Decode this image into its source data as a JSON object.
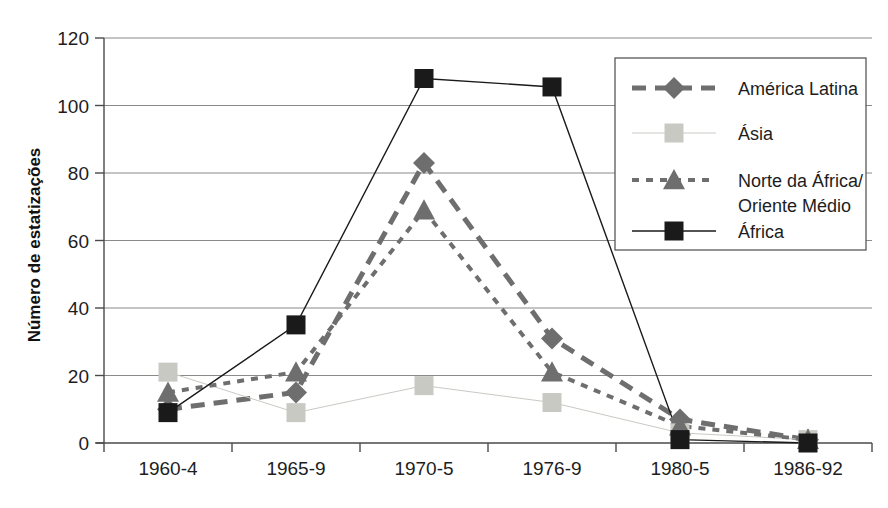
{
  "chart_data": {
    "type": "line",
    "title": "",
    "subtitle": "",
    "xlabel": "",
    "ylabel": "Número de estatizações",
    "categories": [
      "1960-4",
      "1965-9",
      "1970-5",
      "1976-9",
      "1980-5",
      "1986-92"
    ],
    "ylim": [
      0,
      120
    ],
    "yticks": [
      0,
      20,
      40,
      60,
      80,
      100,
      120
    ],
    "ytick_labels": [
      "0",
      "20",
      "40",
      "60",
      "80",
      "100",
      "120"
    ],
    "grid": true,
    "grid_axis": "y",
    "legend_position": "right-top",
    "series": [
      {
        "name": "América Latina",
        "values": [
          10,
          15,
          83,
          31,
          7,
          1
        ],
        "color": "#6e6e6e",
        "marker": "diamond",
        "line_style": "thick-dashed",
        "line_width": 5
      },
      {
        "name": "Ásia",
        "values": [
          21,
          9,
          17,
          12,
          3,
          1
        ],
        "color": "#c9c9c4",
        "marker": "square",
        "line_style": "thin-solid",
        "line_width": 1
      },
      {
        "name": "Norte da África/Oriente Médio",
        "values": [
          15,
          21,
          69,
          21,
          5,
          1
        ],
        "color": "#6e6e6e",
        "marker": "triangle",
        "line_style": "dotted",
        "line_width": 4
      },
      {
        "name": "África",
        "values": [
          9,
          35,
          108,
          105.5,
          1,
          0
        ],
        "color": "#1a1a1a",
        "marker": "square",
        "line_style": "thin-solid",
        "line_width": 1.4
      }
    ]
  },
  "legend": {
    "entries": [
      {
        "label": "América Latina",
        "label_line2": ""
      },
      {
        "label": "Ásia",
        "label_line2": ""
      },
      {
        "label": "Norte da África/",
        "label_line2": "Oriente Médio"
      },
      {
        "label": "África",
        "label_line2": ""
      }
    ]
  },
  "colors": {
    "axis": "#4a4a4a",
    "grid": "#8a8a86",
    "background": "#ffffff",
    "latin_america": "#6e6e6e",
    "asia": "#c9c9c4",
    "north_africa": "#6e6e6e",
    "africa": "#1a1a1a"
  }
}
